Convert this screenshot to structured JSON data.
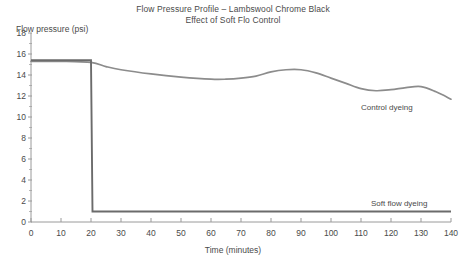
{
  "title": {
    "line1": "Flow Pressure Profile – Lambswool Chrome Black",
    "line2": "Effect of Soft Flo Control"
  },
  "axes": {
    "ylabel": "Flow pressure (psi)",
    "xlabel": "Time (minutes)",
    "yticks": [
      "0",
      "2",
      "4",
      "6",
      "8",
      "10",
      "12",
      "14",
      "16",
      "18"
    ],
    "xticks": [
      "0",
      "10",
      "20",
      "30",
      "40",
      "50",
      "60",
      "70",
      "80",
      "90",
      "100",
      "110",
      "120",
      "130",
      "140"
    ]
  },
  "series_labels": {
    "control": "Control dyeing",
    "softflow": "Soft flow dyeing"
  },
  "colors": {
    "control_line": "#8c8c8c",
    "softflow_line": "#6b6b6b",
    "axis": "#9a9a9a",
    "text": "#4a4a4a",
    "background": "#ffffff"
  },
  "chart_data": {
    "type": "line",
    "xlabel": "Time (minutes)",
    "ylabel": "Flow pressure (psi)",
    "xlim": [
      0,
      140
    ],
    "ylim": [
      0,
      18
    ],
    "xticks": [
      0,
      10,
      20,
      30,
      40,
      50,
      60,
      70,
      80,
      90,
      100,
      110,
      120,
      130,
      140
    ],
    "yticks": [
      0,
      2,
      4,
      6,
      8,
      10,
      12,
      14,
      16,
      18
    ],
    "grid": false,
    "legend": "inline annotations at right of each curve",
    "series": [
      {
        "name": "Control dyeing",
        "color": "#8c8c8c",
        "x": [
          0,
          10,
          20,
          25,
          30,
          40,
          50,
          60,
          65,
          70,
          75,
          80,
          85,
          90,
          95,
          100,
          105,
          110,
          115,
          120,
          125,
          130,
          135,
          140
        ],
        "values": [
          15.3,
          15.3,
          15.2,
          14.8,
          14.5,
          14.1,
          13.8,
          13.6,
          13.6,
          13.7,
          13.9,
          14.3,
          14.5,
          14.5,
          14.2,
          13.7,
          13.2,
          12.7,
          12.5,
          12.6,
          12.8,
          12.9,
          12.4,
          11.7
        ]
      },
      {
        "name": "Soft flow dyeing",
        "color": "#6b6b6b",
        "x": [
          0,
          10,
          19,
          20,
          20.5,
          25,
          40,
          60,
          80,
          100,
          120,
          140
        ],
        "values": [
          15.4,
          15.4,
          15.4,
          15.4,
          1.0,
          1.0,
          1.0,
          1.0,
          1.0,
          1.0,
          1.0,
          1.0
        ]
      }
    ],
    "annotations": [
      {
        "text": "Control dyeing",
        "x": 108,
        "y": 11.0
      },
      {
        "text": "Soft flow dyeing",
        "x": 112,
        "y": 2.2
      }
    ]
  }
}
